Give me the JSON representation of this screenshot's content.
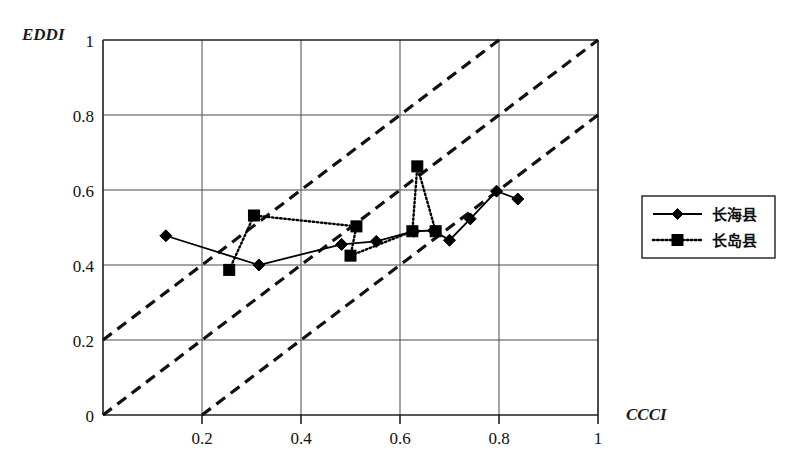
{
  "chart_data": {
    "type": "scatter",
    "title": "",
    "xlabel": "CCCI",
    "ylabel": "EDDI",
    "xlim": [
      0,
      1
    ],
    "ylim": [
      0,
      1
    ],
    "xticks": [
      "0",
      "0.2",
      "0.4",
      "0.6",
      "0.8",
      "1"
    ],
    "yticks": [
      "0",
      "0.2",
      "0.4",
      "0.6",
      "0.8",
      "1"
    ],
    "xtick_values": [
      0,
      0.2,
      0.4,
      0.6,
      0.8,
      1
    ],
    "ytick_values": [
      0,
      0.2,
      0.4,
      0.6,
      0.8,
      1
    ],
    "grid": true,
    "legend_position": "right",
    "series": [
      {
        "name": "长海县",
        "marker": "diamond",
        "line_style": "solid",
        "color": "#000000",
        "points": [
          [
            0.127,
            0.478
          ],
          [
            0.315,
            0.4
          ],
          [
            0.482,
            0.455
          ],
          [
            0.552,
            0.463
          ],
          [
            0.628,
            0.49
          ],
          [
            0.668,
            0.492
          ],
          [
            0.7,
            0.466
          ],
          [
            0.742,
            0.523
          ],
          [
            0.795,
            0.597
          ],
          [
            0.838,
            0.576
          ]
        ]
      },
      {
        "name": "长岛县",
        "marker": "square",
        "line_style": "dotted",
        "color": "#000000",
        "points": [
          [
            0.255,
            0.387
          ],
          [
            0.305,
            0.532
          ],
          [
            0.512,
            0.503
          ],
          [
            0.5,
            0.425
          ],
          [
            0.625,
            0.49
          ],
          [
            0.635,
            0.663
          ],
          [
            0.672,
            0.49
          ]
        ]
      }
    ],
    "reference_lines": [
      {
        "name": "upper-diagonal",
        "from": [
          0.0,
          0.2
        ],
        "to": [
          0.8,
          1.0
        ],
        "style": "dashed"
      },
      {
        "name": "center-diagonal",
        "from": [
          0.0,
          0.0
        ],
        "to": [
          1.0,
          1.0
        ],
        "style": "dashed"
      },
      {
        "name": "lower-diagonal",
        "from": [
          0.2,
          0.0
        ],
        "to": [
          1.0,
          0.8
        ],
        "style": "dashed"
      }
    ]
  },
  "legend": {
    "entries": [
      {
        "label": "长海县",
        "marker": "diamond",
        "style": "solid"
      },
      {
        "label": "长岛县",
        "marker": "square",
        "style": "dotted"
      }
    ]
  },
  "axes": {
    "y_axis_title": "EDDI",
    "x_axis_title": "CCCI"
  }
}
